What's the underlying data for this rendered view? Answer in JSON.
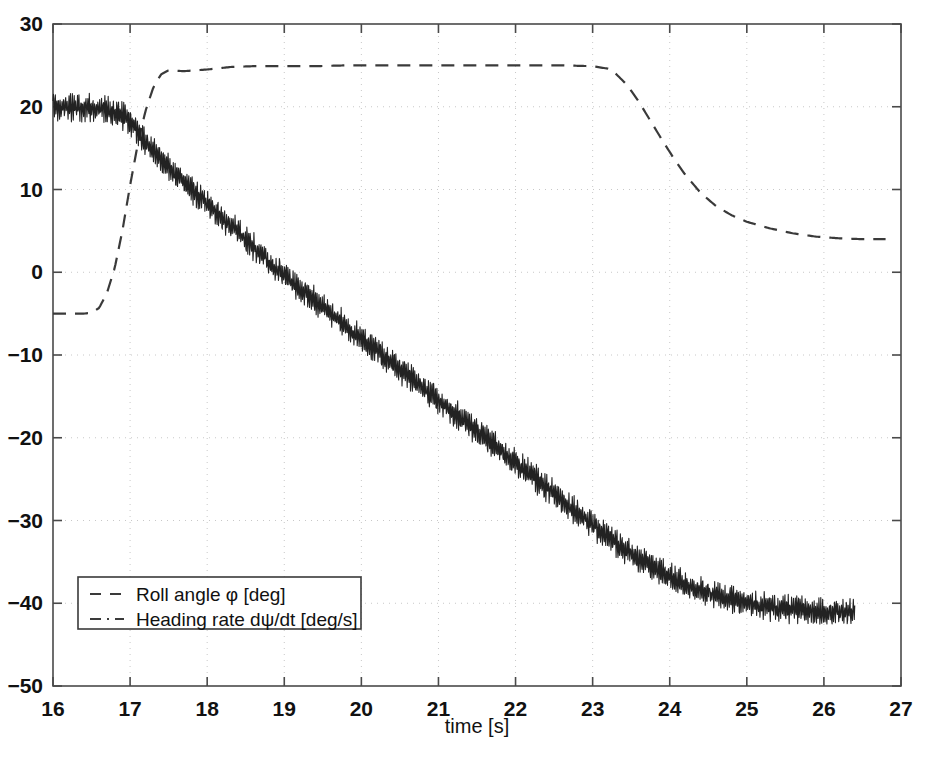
{
  "chart_data": {
    "type": "line",
    "title": "",
    "xlabel": "time [s]",
    "ylabel": "",
    "xlim": [
      16,
      27
    ],
    "ylim": [
      -50,
      30
    ],
    "xticks": [
      16,
      17,
      18,
      19,
      20,
      21,
      22,
      23,
      24,
      25,
      26,
      27
    ],
    "yticks": [
      30,
      20,
      10,
      0,
      -10,
      -20,
      -30,
      -40,
      -50
    ],
    "grid": true,
    "grid_style": "dotted",
    "legend_position": "lower-left",
    "series": [
      {
        "name": "Roll angle φ [deg]",
        "linestyle": "dashed",
        "color": "#3a3a3a",
        "noise": 0,
        "x": [
          16.0,
          16.2,
          16.4,
          16.5,
          16.6,
          16.7,
          16.8,
          16.9,
          17.0,
          17.1,
          17.2,
          17.3,
          17.4,
          17.5,
          17.7,
          18.0,
          18.3,
          18.6,
          19.0,
          19.4,
          19.8,
          20.2,
          20.6,
          21.0,
          21.4,
          21.8,
          22.2,
          22.6,
          23.0,
          23.2,
          23.3,
          23.45,
          23.6,
          23.75,
          23.9,
          24.05,
          24.2,
          24.4,
          24.6,
          24.8,
          25.0,
          25.3,
          25.6,
          25.9,
          26.2,
          26.5,
          26.8
        ],
        "y": [
          -5.0,
          -5.0,
          -5.0,
          -4.9,
          -4.3,
          -2.5,
          0.5,
          5.0,
          10.5,
          15.5,
          19.5,
          22.3,
          23.9,
          24.4,
          24.3,
          24.5,
          24.8,
          24.9,
          24.9,
          24.9,
          25.0,
          25.0,
          25.0,
          25.0,
          25.0,
          25.0,
          25.0,
          25.0,
          24.9,
          24.6,
          24.0,
          22.6,
          20.6,
          18.3,
          16.0,
          13.8,
          11.8,
          9.6,
          8.0,
          6.9,
          6.1,
          5.3,
          4.7,
          4.3,
          4.1,
          4.0,
          4.0
        ]
      },
      {
        "name": "Heading rate dψ/dt [deg/s]",
        "linestyle": "dashdot",
        "color": "#222222",
        "noise": 1.4,
        "x": [
          16.0,
          16.1,
          16.2,
          16.3,
          16.4,
          16.5,
          16.6,
          16.7,
          16.8,
          16.9,
          17.0,
          17.1,
          17.2,
          17.3,
          17.5,
          17.8,
          18.1,
          18.4,
          18.7,
          19.0,
          19.3,
          19.6,
          20.0,
          20.4,
          20.8,
          21.2,
          21.6,
          22.0,
          22.4,
          22.8,
          23.1,
          23.4,
          23.7,
          24.0,
          24.3,
          24.6,
          24.9,
          25.2,
          25.5,
          25.8,
          26.1,
          26.4
        ],
        "y": [
          20.0,
          20.0,
          20.0,
          20.0,
          19.9,
          19.9,
          19.8,
          19.7,
          19.4,
          19.0,
          18.2,
          17.0,
          15.8,
          14.6,
          12.6,
          10.0,
          7.4,
          4.8,
          2.2,
          -0.4,
          -2.7,
          -5.0,
          -8.0,
          -11.0,
          -14.0,
          -17.0,
          -20.0,
          -23.0,
          -26.0,
          -29.0,
          -31.3,
          -33.4,
          -35.2,
          -36.8,
          -38.1,
          -39.1,
          -39.8,
          -40.3,
          -40.7,
          -40.9,
          -41.0,
          -41.1
        ]
      }
    ]
  },
  "legend": {
    "items": [
      {
        "label": "Roll angle φ [deg]",
        "style": "dashed"
      },
      {
        "label": "Heading rate dψ/dt [deg/s]",
        "style": "dashdot"
      }
    ]
  },
  "axes": {
    "x_title": "time [s]",
    "x_tick_labels": [
      "16",
      "17",
      "18",
      "19",
      "20",
      "21",
      "22",
      "23",
      "24",
      "25",
      "26",
      "27"
    ],
    "y_tick_labels": [
      "30",
      "20",
      "10",
      "0",
      "−10",
      "−20",
      "−30",
      "−40",
      "−50"
    ]
  },
  "style": {
    "axis_color": "#4a4a4a",
    "grid_color": "#c8c8c8",
    "background": "#ffffff"
  }
}
